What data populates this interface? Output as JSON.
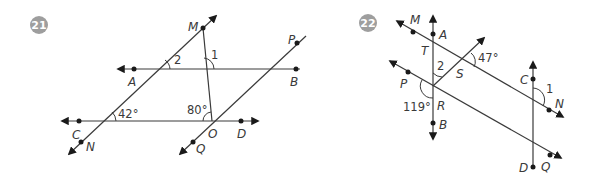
{
  "colors": {
    "line": "#3a3a3a",
    "point": "#1a1a1a",
    "badge": "#9e9e9e",
    "badge_text": "#ffffff",
    "background": "#ffffff"
  },
  "problems": [
    {
      "number": "21",
      "points": {
        "M": "M",
        "A": "A",
        "B": "B",
        "C": "C",
        "D": "D",
        "O": "O",
        "N": "N",
        "P": "P",
        "Q": "Q"
      },
      "lines": [
        "line AB",
        "line CD",
        "line MN",
        "line PQ",
        "segment MO"
      ],
      "angles": {
        "angle_1": "1",
        "angle_2": "2",
        "angle_CNM": "42°",
        "angle_MOC": "80°"
      }
    },
    {
      "number": "22",
      "points": {
        "M": "M",
        "A": "A",
        "T": "T",
        "S": "S",
        "P": "P",
        "R": "R",
        "B": "B",
        "C": "C",
        "N": "N",
        "D": "D",
        "Q": "Q"
      },
      "lines": [
        "line AB",
        "line CD",
        "line MN",
        "line PQ",
        "ray RS"
      ],
      "angles": {
        "angle_1": "1",
        "angle_2": "2",
        "angle_S": "47°",
        "angle_R": "119°"
      }
    }
  ]
}
